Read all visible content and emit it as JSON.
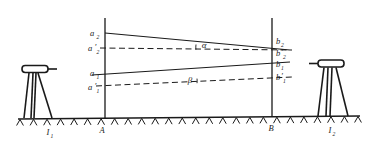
{
  "figure": {
    "type": "surveying-diagram",
    "background_color": "#ffffff",
    "ink_color": "#1a1a1a"
  },
  "stations": {
    "left": {
      "ground_label": "A",
      "instrument_label": "I",
      "instrument_sub": "1",
      "staff_x": 105
    },
    "right": {
      "ground_label": "B",
      "instrument_label": "I",
      "instrument_sub": "2",
      "staff_x": 272
    }
  },
  "staff_points": {
    "left": [
      {
        "label": "a",
        "sub": "2",
        "prime": false,
        "y": 33
      },
      {
        "label": "a",
        "sub": "2",
        "prime": true,
        "y": 48
      },
      {
        "label": "a",
        "sub": "1",
        "prime": false,
        "y": 73
      },
      {
        "label": "a",
        "sub": "1",
        "prime": true,
        "y": 86
      }
    ],
    "right": [
      {
        "label": "b",
        "sub": "2",
        "prime": false,
        "y": 41
      },
      {
        "label": "b",
        "sub": "2",
        "prime": true,
        "y": 52
      },
      {
        "label": "b",
        "sub": "1",
        "prime": false,
        "y": 64
      },
      {
        "label": "b",
        "sub": "1",
        "prime": true,
        "y": 77
      }
    ]
  },
  "sight_lines": [
    {
      "name": "upper-sight-line",
      "from": [
        105,
        33
      ],
      "to": [
        272,
        49
      ],
      "style": "solid"
    },
    {
      "name": "lower-sight-line",
      "from": [
        105,
        73
      ],
      "to": [
        272,
        62
      ],
      "style": "solid"
    }
  ],
  "reference_lines": [
    {
      "name": "upper-horizontal-reference",
      "from": [
        105,
        48
      ],
      "to": [
        290,
        50
      ],
      "style": "dashed"
    },
    {
      "name": "lower-horizontal-reference",
      "from": [
        100,
        86
      ],
      "to": [
        290,
        77
      ],
      "style": "dashed"
    }
  ],
  "angles": [
    {
      "name": "alpha",
      "symbol": "α",
      "x": 211,
      "y": 45,
      "arc_at": [
        205,
        48
      ]
    },
    {
      "name": "beta",
      "symbol": "β",
      "x": 189,
      "y": 80,
      "arc_at": [
        183,
        83
      ]
    }
  ],
  "ground": {
    "line_y": 118,
    "hatch_count": 26,
    "label_y": 132
  }
}
